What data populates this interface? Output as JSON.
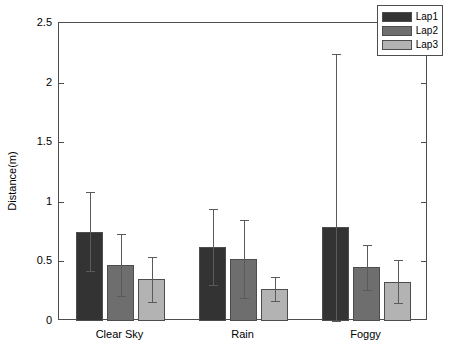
{
  "chart_data": {
    "type": "bar",
    "title": "",
    "xlabel": "",
    "ylabel": "Distance(m)",
    "categories": [
      "Clear Sky",
      "Rain",
      "Foggy"
    ],
    "ylim": [
      0,
      2.5
    ],
    "yticks": [
      0,
      0.5,
      1,
      1.5,
      2,
      2.5
    ],
    "ytick_labels": [
      "0",
      "0.5",
      "1",
      "1.5",
      "2",
      "2.5"
    ],
    "grid": false,
    "legend_position": "top-right",
    "error_bars": true,
    "series": [
      {
        "name": "Lap1",
        "color": "#333333",
        "values": [
          0.75,
          0.62,
          0.79
        ],
        "errors": [
          0.33,
          0.32,
          1.45
        ]
      },
      {
        "name": "Lap2",
        "color": "#6e6e6e",
        "values": [
          0.47,
          0.52,
          0.45
        ],
        "errors": [
          0.26,
          0.33,
          0.19
        ]
      },
      {
        "name": "Lap3",
        "color": "#b3b3b3",
        "values": [
          0.35,
          0.27,
          0.33
        ],
        "errors": [
          0.19,
          0.1,
          0.18
        ]
      }
    ]
  },
  "axes": {
    "box_color": "#4d4d4d",
    "error_bar_color": "#5a5a5a"
  }
}
